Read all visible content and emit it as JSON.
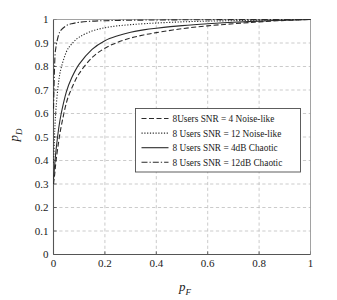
{
  "chart_data": {
    "type": "line",
    "title": "",
    "subtitle": "",
    "xlabel": "p_F",
    "ylabel": "p_D",
    "xlabel_base": "p",
    "xlabel_sub": "F",
    "ylabel_base": "p",
    "ylabel_sub": "D",
    "xlim": [
      0,
      1
    ],
    "ylim": [
      0,
      1
    ],
    "grid": true,
    "grid_style": "dashed",
    "grid_color": "#b4b4b4",
    "axis_color": "#555555",
    "line_color": "#2b2b2b",
    "legend_position": "center",
    "xticks": [
      0,
      0.2,
      0.4,
      0.6,
      0.8,
      1
    ],
    "xtick_labels": [
      "0",
      "0.2",
      "0.4",
      "0.6",
      "0.8",
      "1"
    ],
    "yticks": [
      0,
      0.1,
      0.2,
      0.3,
      0.4,
      0.5,
      0.6,
      0.7,
      0.8,
      0.9,
      1
    ],
    "ytick_labels": [
      "0",
      "0.1",
      "0.2",
      "0.3",
      "0.4",
      "0.5",
      "0.6",
      "0.7",
      "0.8",
      "0.9",
      "1"
    ],
    "x": [
      0,
      0.005,
      0.01,
      0.02,
      0.03,
      0.05,
      0.07,
      0.1,
      0.15,
      0.2,
      0.25,
      0.3,
      0.35,
      0.4,
      0.5,
      0.6,
      0.7,
      0.8,
      0.9,
      1
    ],
    "series": [
      {
        "name": "8Users SNR = 4 Noise-like",
        "style": "dashed",
        "dasharray": "5,2.5",
        "width": 1.1,
        "values": [
          0.3,
          0.345,
          0.4,
          0.48,
          0.545,
          0.645,
          0.705,
          0.77,
          0.838,
          0.878,
          0.903,
          0.921,
          0.934,
          0.944,
          0.961,
          0.973,
          0.982,
          0.99,
          0.996,
          1.0
        ]
      },
      {
        "name": "8 Users SNR = 12 Noise-like",
        "style": "dotted",
        "dasharray": "1.2,1.6",
        "width": 1.1,
        "values": [
          0.39,
          0.53,
          0.625,
          0.735,
          0.795,
          0.862,
          0.895,
          0.925,
          0.951,
          0.965,
          0.973,
          0.978,
          0.982,
          0.985,
          0.99,
          0.993,
          0.995,
          0.997,
          0.999,
          1.0
        ]
      },
      {
        "name": "8 Users SNR = 4dB Chaotic",
        "style": "solid",
        "dasharray": "none",
        "width": 1.1,
        "values": [
          0.32,
          0.385,
          0.445,
          0.535,
          0.6,
          0.692,
          0.75,
          0.81,
          0.873,
          0.91,
          0.931,
          0.946,
          0.956,
          0.963,
          0.974,
          0.982,
          0.988,
          0.993,
          0.997,
          1.0
        ]
      },
      {
        "name": "8 Users SNR = 12dB Chaotic",
        "style": "dashdot",
        "dasharray": "6,2,1.3,2",
        "width": 1.1,
        "values": [
          0.62,
          0.825,
          0.885,
          0.935,
          0.956,
          0.974,
          0.982,
          0.988,
          0.993,
          0.995,
          0.996,
          0.997,
          0.9975,
          0.998,
          0.9987,
          0.9992,
          0.9995,
          0.9997,
          0.9999,
          1.0
        ]
      }
    ]
  },
  "legend": {
    "items": [
      {
        "label": "8Users SNR = 4 Noise-like"
      },
      {
        "label": "8 Users SNR = 12 Noise-like"
      },
      {
        "label": "8 Users SNR = 4dB Chaotic"
      },
      {
        "label": "8 Users SNR = 12dB Chaotic"
      }
    ]
  }
}
